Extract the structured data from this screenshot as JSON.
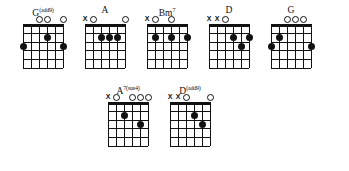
{
  "document": {
    "type": "guitar-chord-chart",
    "background_color": "#ffffff",
    "ink_color": "#111111",
    "string_count": 6,
    "fret_count": 5,
    "marker_glyphs": {
      "open": "O",
      "muted": "X"
    }
  },
  "chords": [
    {
      "id": "g-add9",
      "name_root": "G",
      "name_super": "(add9)",
      "name_plain": "G(add9)",
      "markers": [
        "",
        "",
        "O",
        "O",
        "",
        "O"
      ],
      "dots": [
        {
          "string": 6,
          "fret": 3
        },
        {
          "string": 3,
          "fret": 2
        },
        {
          "string": 1,
          "fret": 3
        }
      ]
    },
    {
      "id": "a",
      "name_root": "A",
      "name_super": "",
      "name_plain": "A",
      "markers": [
        "X",
        "O",
        "",
        "",
        "",
        "O"
      ],
      "dots": [
        {
          "string": 4,
          "fret": 2
        },
        {
          "string": 3,
          "fret": 2
        },
        {
          "string": 2,
          "fret": 2
        }
      ]
    },
    {
      "id": "b-minor-7",
      "name_root": "Bm",
      "name_super": "7",
      "name_plain": "Bm7",
      "markers": [
        "X",
        "O",
        "",
        "O",
        "",
        ""
      ],
      "dots": [
        {
          "string": 5,
          "fret": 2
        },
        {
          "string": 3,
          "fret": 2
        },
        {
          "string": 1,
          "fret": 2
        }
      ]
    },
    {
      "id": "d",
      "name_root": "D",
      "name_super": "",
      "name_plain": "D",
      "markers": [
        "X",
        "X",
        "O",
        "",
        "",
        ""
      ],
      "dots": [
        {
          "string": 3,
          "fret": 2
        },
        {
          "string": 1,
          "fret": 2
        },
        {
          "string": 2,
          "fret": 3
        }
      ]
    },
    {
      "id": "g",
      "name_root": "G",
      "name_super": "",
      "name_plain": "G",
      "markers": [
        "",
        "",
        "O",
        "O",
        "O",
        ""
      ],
      "dots": [
        {
          "string": 5,
          "fret": 2
        },
        {
          "string": 6,
          "fret": 3
        },
        {
          "string": 1,
          "fret": 3
        }
      ]
    },
    {
      "id": "a7-sus4",
      "name_root": "A",
      "name_super": "7(sus4)",
      "name_plain": "A7(sus4)",
      "markers": [
        "X",
        "O",
        "",
        "O",
        "O",
        "O"
      ],
      "dots": [
        {
          "string": 4,
          "fret": 2
        },
        {
          "string": 2,
          "fret": 3
        }
      ]
    },
    {
      "id": "d-add9",
      "name_root": "D",
      "name_super": "(add9)",
      "name_plain": "D(add9)",
      "markers": [
        "X",
        "X",
        "O",
        "",
        "",
        "O"
      ],
      "dots": [
        {
          "string": 3,
          "fret": 2
        },
        {
          "string": 2,
          "fret": 3
        }
      ]
    }
  ],
  "rows": [
    {
      "id": "row-top",
      "chord_ids": [
        "g-add9",
        "a",
        "b-minor-7",
        "d",
        "g"
      ]
    },
    {
      "id": "row-bottom",
      "chord_ids": [
        "a7-sus4",
        "d-add9"
      ]
    }
  ]
}
